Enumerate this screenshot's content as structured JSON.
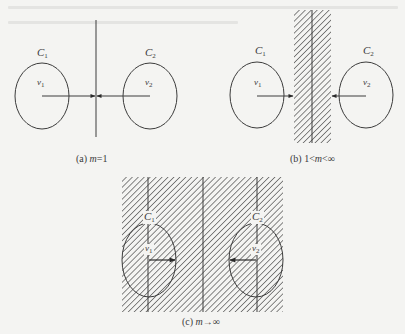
{
  "figure": {
    "panels": [
      {
        "id": "a",
        "caption_prefix": "(a) ",
        "caption_var": "m",
        "caption_rest": "=1",
        "circles": [
          {
            "label": "C",
            "sub": "1",
            "inner_label": "v",
            "inner_sub": "1"
          },
          {
            "label": "C",
            "sub": "2",
            "inner_label": "v",
            "inner_sub": "2"
          }
        ]
      },
      {
        "id": "b",
        "caption_prefix": "(b) 1<",
        "caption_var": "m",
        "caption_rest": "<∞",
        "circles": [
          {
            "label": "C",
            "sub": "1",
            "inner_label": "v",
            "inner_sub": "1"
          },
          {
            "label": "C",
            "sub": "2",
            "inner_label": "v",
            "inner_sub": "2"
          }
        ]
      },
      {
        "id": "c",
        "caption_prefix": "(c) ",
        "caption_var": "m",
        "caption_rest": "→∞",
        "circles": [
          {
            "label": "C",
            "sub": "1",
            "inner_label": "v",
            "inner_sub": "1"
          },
          {
            "label": "C",
            "sub": "2",
            "inner_label": "v",
            "inner_sub": "2"
          }
        ]
      }
    ],
    "colors": {
      "stroke": "#3c3c3c",
      "hatch": "#4a4a4a",
      "background": "#f4f4f2"
    }
  }
}
